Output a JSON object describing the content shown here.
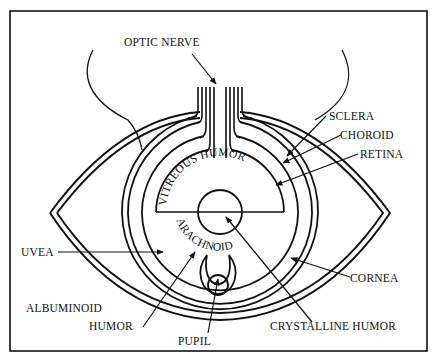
{
  "diagram": {
    "labels": {
      "optic_nerve": "OPTIC NERVE",
      "sclera": "SCLERA",
      "choroid": "CHOROID",
      "retina": "RETINA",
      "vitreous_humor": "VITREOUS HUMOR",
      "arachnoid": "ARACHNOID",
      "uvea": "UVEA",
      "cornea": "CORNEA",
      "albuminoid": "ALBUMINOID",
      "humor": "HUMOR",
      "pupil": "PUPIL",
      "crystalline_humor": "CRYSTALLINE HUMOR"
    },
    "colors": {
      "line": "#111111",
      "background": "#ffffff"
    }
  }
}
